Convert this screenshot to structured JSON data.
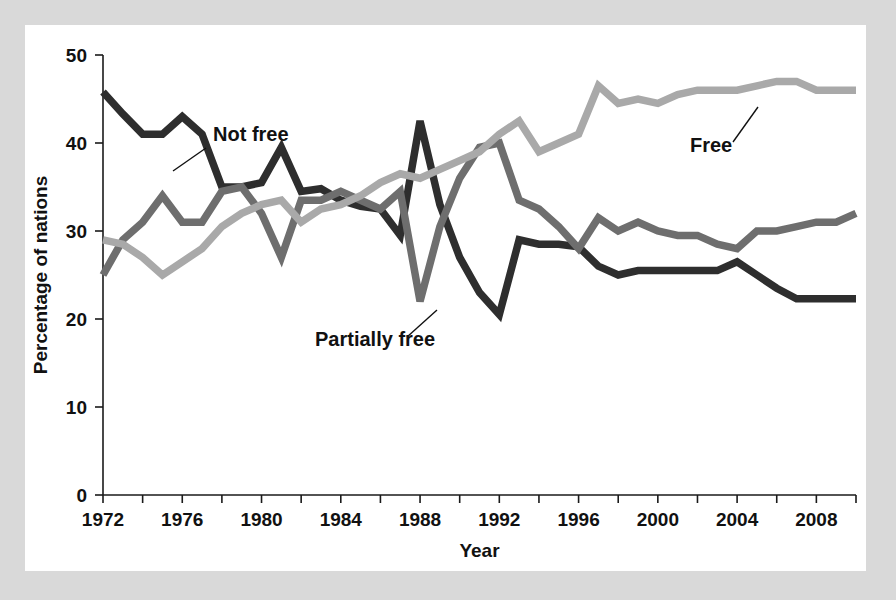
{
  "figure": {
    "background_color": "#d9d9d9",
    "card_color": "#ffffff"
  },
  "chart_data": {
    "type": "line",
    "title": "",
    "xlabel": "Year",
    "ylabel": "Percentage of nations",
    "xlim": [
      1972,
      2010
    ],
    "ylim": [
      0,
      50
    ],
    "grid": false,
    "legend_position": "inline-annotations",
    "xticks": [
      1972,
      1974,
      1976,
      1978,
      1980,
      1982,
      1984,
      1986,
      1988,
      1990,
      1992,
      1994,
      1996,
      1998,
      2000,
      2002,
      2004,
      2006,
      2008,
      2010
    ],
    "xtick_labels": [
      "1972",
      "",
      "1976",
      "",
      "1980",
      "",
      "1984",
      "",
      "1988",
      "",
      "1992",
      "",
      "1996",
      "",
      "2000",
      "",
      "2004",
      "",
      "2008",
      ""
    ],
    "yticks": [
      0,
      10,
      20,
      30,
      40,
      50
    ],
    "ytick_labels": [
      "0",
      "10",
      "20",
      "30",
      "40",
      "50"
    ],
    "x": [
      1972,
      1973,
      1974,
      1975,
      1976,
      1977,
      1978,
      1979,
      1980,
      1981,
      1982,
      1983,
      1984,
      1985,
      1986,
      1987,
      1988,
      1989,
      1990,
      1991,
      1992,
      1993,
      1994,
      1995,
      1996,
      1997,
      1998,
      1999,
      2000,
      2001,
      2002,
      2003,
      2004,
      2005,
      2006,
      2007,
      2008,
      2009,
      2010
    ],
    "series": [
      {
        "name": "Not free",
        "color": "#2e2e2e",
        "values": [
          45.8,
          43.3,
          41.0,
          41.0,
          43.0,
          41.0,
          35.0,
          35.0,
          35.5,
          39.5,
          34.5,
          34.8,
          33.5,
          32.8,
          32.5,
          29.5,
          42.5,
          33.0,
          27.0,
          23.0,
          20.5,
          29.0,
          28.5,
          28.5,
          28.2,
          26.0,
          25.0,
          25.5,
          25.5,
          25.5,
          25.5,
          25.5,
          26.5,
          25.0,
          23.5,
          22.3,
          22.3,
          22.3,
          22.3
        ]
      },
      {
        "name": "Partially free",
        "color": "#6e6e6e",
        "values": [
          25.0,
          29.0,
          31.0,
          34.0,
          31.0,
          31.0,
          34.5,
          35.0,
          32.0,
          27.0,
          33.5,
          33.5,
          34.5,
          33.5,
          32.5,
          34.5,
          22.0,
          30.5,
          36.0,
          39.5,
          40.0,
          33.5,
          32.5,
          30.5,
          28.0,
          31.5,
          30.0,
          31.0,
          30.0,
          29.5,
          29.5,
          28.5,
          28.0,
          30.0,
          30.0,
          30.5,
          31.0,
          31.0,
          32.0
        ]
      },
      {
        "name": "Free",
        "color": "#a9a9a9",
        "values": [
          29.0,
          28.5,
          27.0,
          25.0,
          26.5,
          28.0,
          30.5,
          32.0,
          33.0,
          33.5,
          31.0,
          32.5,
          33.0,
          34.0,
          35.5,
          36.5,
          36.0,
          37.0,
          38.0,
          39.0,
          41.0,
          42.5,
          39.0,
          40.0,
          41.0,
          46.5,
          44.5,
          45.0,
          44.5,
          45.5,
          46.0,
          46.0,
          46.0,
          46.5,
          47.0,
          47.0,
          46.0,
          46.0,
          46.0
        ]
      }
    ],
    "annotations": [
      {
        "text": "Not free",
        "series": "Not free",
        "label_x": 188,
        "label_y": 116,
        "leader_from_x": 181,
        "leader_from_y": 123,
        "leader_to_x": 148,
        "leader_to_y": 146
      },
      {
        "text": "Partially free",
        "series": "Partially free",
        "label_x": 290,
        "label_y": 321,
        "leader_from_x": 382,
        "leader_from_y": 312,
        "leader_to_x": 412,
        "leader_to_y": 285
      },
      {
        "text": "Free",
        "series": "Free",
        "label_x": 665,
        "label_y": 127,
        "leader_from_x": 708,
        "leader_from_y": 117,
        "leader_to_x": 733,
        "leader_to_y": 82
      }
    ]
  }
}
